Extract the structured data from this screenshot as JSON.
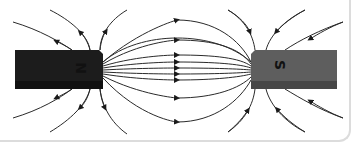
{
  "diagram": {
    "magnets": [
      {
        "id": "north",
        "label": "N",
        "color": "#1c1c1c",
        "edge_color": "#111111"
      },
      {
        "id": "south",
        "label": "S",
        "color": "#5e5e5e",
        "edge_color": "#474747"
      }
    ],
    "field_line_color": "#2a2a2a",
    "frame_border_color": "#dcdcdc"
  }
}
